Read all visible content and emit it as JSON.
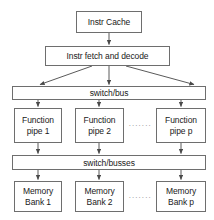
{
  "diagram": {
    "colors": {
      "background": "#ffffff",
      "stroke": "#6e6e6e",
      "text": "#1a1a1a",
      "ellipsis": "#8a8a8a"
    },
    "nodes": {
      "instr_cache": {
        "label": "Instr Cache"
      },
      "instr_fetch": {
        "label": "Instr fetch and decode"
      },
      "switch_bus": {
        "label": "switch/bus"
      },
      "switch_busses": {
        "label": "switch/busses"
      },
      "function_pipes": [
        {
          "line1": "Function",
          "line2": "pipe 1"
        },
        {
          "line1": "Function",
          "line2": "pipe 2"
        },
        {
          "line1": "Function",
          "line2": "pipe p"
        }
      ],
      "memory_banks": [
        {
          "line1": "Memory",
          "line2": "Bank 1"
        },
        {
          "line1": "Memory",
          "line2": "Bank 2"
        },
        {
          "line1": "Memory",
          "line2": "Bank p"
        }
      ]
    },
    "ellipsis": {
      "pipes": "·······",
      "banks": "·······"
    }
  }
}
